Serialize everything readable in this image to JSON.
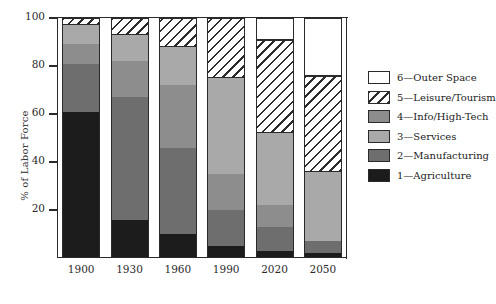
{
  "chart_data": {
    "type": "bar",
    "subtype": "stacked-percentage-column",
    "title": "",
    "xlabel": "",
    "ylabel": "% of Labor Force",
    "ylim": [
      0,
      100
    ],
    "yticks": [
      0,
      20,
      40,
      60,
      80,
      100
    ],
    "ytick_labels": [
      "0",
      "20",
      "40",
      "60",
      "80",
      "100"
    ],
    "grid": false,
    "legend_position": "right",
    "categories": [
      "1900",
      "1930",
      "1960",
      "1990",
      "2020",
      "2050"
    ],
    "series": [
      {
        "name": "1—Agriculture",
        "key": "agriculture",
        "color": "#1c1c1c",
        "pattern": "solid",
        "values": [
          61,
          16,
          10,
          5,
          3,
          2
        ]
      },
      {
        "name": "2—Manufacturing",
        "key": "manufacturing",
        "color": "#6e6e6e",
        "pattern": "solid",
        "values": [
          20,
          51,
          36,
          15,
          10,
          5
        ]
      },
      {
        "name": "3—Services",
        "key": "services",
        "color": "#a9a9a9",
        "pattern": "solid",
        "values": [
          8,
          11,
          16,
          40,
          30,
          29
        ]
      },
      {
        "name": "4—Info/High-Tech",
        "key": "info",
        "color": "#8d8d8d",
        "pattern": "solid",
        "values": [
          8,
          15,
          26,
          15,
          9,
          0
        ]
      },
      {
        "name": "5—Leisure/Tourism",
        "key": "leisure",
        "color": "#ffffff",
        "pattern": "diagonal-hatch",
        "values": [
          3,
          7,
          12,
          25,
          39,
          40
        ]
      },
      {
        "name": "6—Outer Space",
        "key": "space",
        "color": "#ffffff",
        "pattern": "empty",
        "values": [
          0,
          0,
          0,
          0,
          9,
          24
        ]
      }
    ],
    "stack_order_bottom_to_top": [
      "agriculture",
      "manufacturing",
      "info",
      "services",
      "leisure",
      "space"
    ]
  },
  "legend": {
    "items": [
      {
        "label": "6—Outer Space",
        "swatch": "empty"
      },
      {
        "label": "5—Leisure/Tourism",
        "swatch": "diagonal-hatch"
      },
      {
        "label": "4—Info/High-Tech",
        "swatch": "medium-gray"
      },
      {
        "label": "3—Services",
        "swatch": "light-gray"
      },
      {
        "label": "2—Manufacturing",
        "swatch": "dark-gray"
      },
      {
        "label": "1—Agriculture",
        "swatch": "black"
      }
    ]
  }
}
